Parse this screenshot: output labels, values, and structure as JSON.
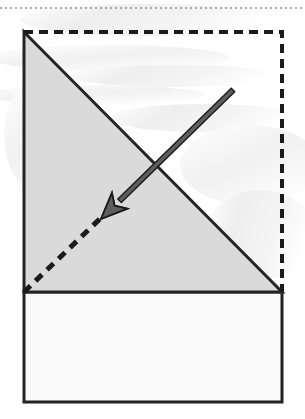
{
  "figure": {
    "title": "Origami valley-fold step diagram",
    "canvas": {
      "width": 305,
      "height": 419
    },
    "background_color": "#ffffff",
    "watermark_note": "faint gray show-through texture from reverse of page"
  },
  "colors": {
    "ink": "#1b1b1b",
    "stroke": "#242424",
    "gray_fill": "#dadada",
    "white_fill": "#fafafa",
    "arrow_fill": "#5e5e5e",
    "arrow_outline": "#1b1b1b",
    "hairline": "#8e8e8e",
    "watermark": "#e9e9e9"
  },
  "geometry": {
    "page_rule": {
      "name": "top-hairline-rule",
      "y": 8,
      "x1": 0,
      "x2": 305,
      "dash": "2 3",
      "width": 1
    },
    "square_outline": {
      "name": "original-square-dashed-outline",
      "top_left": {
        "x": 24,
        "y": 32
      },
      "top_right": {
        "x": 282,
        "y": 32
      },
      "bottom_right": {
        "x": 282,
        "y": 292
      },
      "dash": "9 6",
      "width": 4
    },
    "gray_triangle": {
      "name": "folded-gray-triangle",
      "points": [
        {
          "x": 24,
          "y": 32
        },
        {
          "x": 282,
          "y": 292
        },
        {
          "x": 24,
          "y": 292
        }
      ],
      "fill": "#dadada",
      "stroke_width": 3
    },
    "lower_rectangle": {
      "name": "lower-white-panel",
      "x": 24,
      "y": 292,
      "width": 258,
      "height": 110,
      "fill": "#fafafa",
      "stroke_width": 3
    },
    "crease_line": {
      "name": "fold-crease-dashed-diagonal",
      "from": {
        "x": 24,
        "y": 292
      },
      "to": {
        "x": 107,
        "y": 212
      },
      "dash": "9 7",
      "width": 5
    },
    "fold_arrow": {
      "name": "fold-direction-arrow",
      "tail": {
        "x": 233,
        "y": 90
      },
      "tip": {
        "x": 101,
        "y": 219
      },
      "shaft_width": 5,
      "head_length": 26,
      "head_width": 22,
      "direction": "down-left"
    }
  },
  "labels": {
    "figure_caption": "",
    "step_number": ""
  }
}
